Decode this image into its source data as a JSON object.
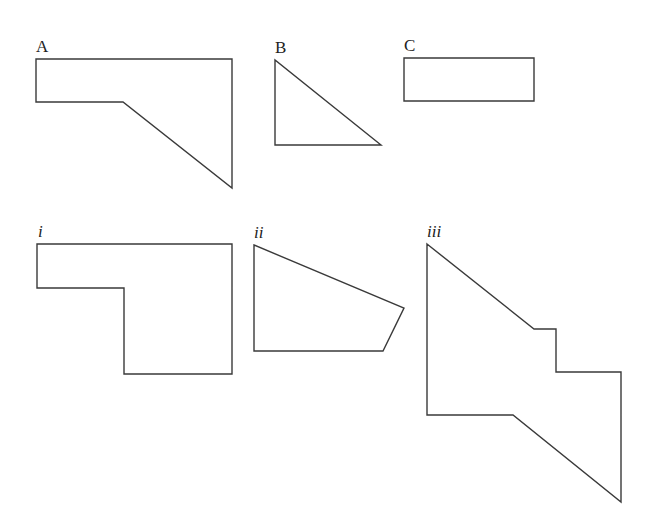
{
  "diagram": {
    "title": "",
    "labels": {
      "A": "A",
      "B": "B",
      "C": "C",
      "i": "i",
      "ii": "ii",
      "iii": "iii"
    },
    "shapes": [
      {
        "id": "A",
        "points": [
          [
            36,
            59
          ],
          [
            232,
            59
          ],
          [
            232,
            188
          ],
          [
            123,
            102
          ],
          [
            36,
            102
          ]
        ]
      },
      {
        "id": "B",
        "points": [
          [
            275,
            60
          ],
          [
            275,
            145
          ],
          [
            381,
            145
          ]
        ]
      },
      {
        "id": "C",
        "points": [
          [
            404,
            58
          ],
          [
            534,
            58
          ],
          [
            534,
            101
          ],
          [
            404,
            101
          ]
        ]
      },
      {
        "id": "i",
        "points": [
          [
            37,
            244
          ],
          [
            232,
            244
          ],
          [
            232,
            374
          ],
          [
            124,
            374
          ],
          [
            124,
            288
          ],
          [
            37,
            288
          ]
        ]
      },
      {
        "id": "ii",
        "points": [
          [
            254,
            245
          ],
          [
            404,
            308
          ],
          [
            383,
            351
          ],
          [
            254,
            351
          ]
        ]
      },
      {
        "id": "iii",
        "points": [
          [
            427,
            244
          ],
          [
            534,
            329
          ],
          [
            556,
            329
          ],
          [
            556,
            372
          ],
          [
            621,
            372
          ],
          [
            621,
            502
          ],
          [
            513,
            415
          ],
          [
            427,
            415
          ]
        ]
      }
    ],
    "colors": {
      "stroke": "#3a3a3a",
      "background": "#ffffff"
    }
  }
}
